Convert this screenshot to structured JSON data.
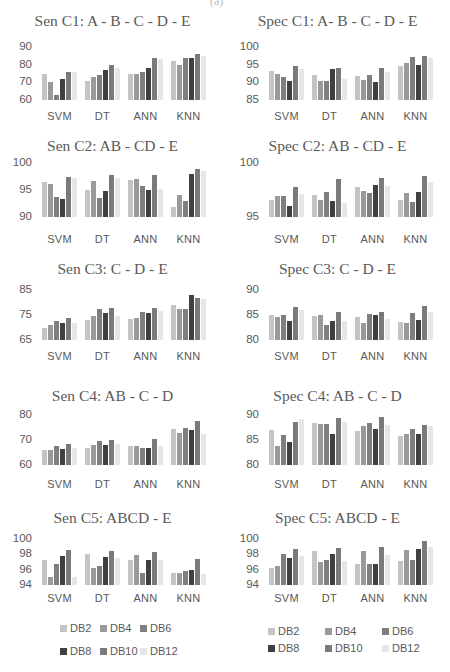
{
  "page_fragment": "(a)",
  "series_names": [
    "DB2",
    "DB4",
    "DB6",
    "DB8",
    "DB10",
    "DB12"
  ],
  "series_colors": [
    "#c4c4c4",
    "#9a9a9a",
    "#7f7f7f",
    "#404040",
    "#7a7a7a",
    "#e6e6e6"
  ],
  "legends": [
    {
      "items": [
        {
          "label": "DB2"
        },
        {
          "label": "DB4"
        },
        {
          "label": "DB6"
        },
        {
          "label": "DB8"
        },
        {
          "label": "DB10"
        },
        {
          "label": "DB12"
        }
      ]
    },
    {
      "items": [
        {
          "label": "DB2"
        },
        {
          "label": "DB4"
        },
        {
          "label": "DB6"
        },
        {
          "label": "DB8"
        },
        {
          "label": "DB10"
        },
        {
          "label": "DB12"
        }
      ]
    }
  ],
  "chart_data": [
    {
      "type": "bar",
      "title": "Sen C1: A - B - C - D - E",
      "xlabel": "",
      "ylabel": "",
      "categories": [
        "SVM",
        "DT",
        "ANN",
        "KNN"
      ],
      "ylim": [
        60,
        90
      ],
      "yticks": [
        "90",
        "80",
        "70",
        "60"
      ],
      "legend_position": "bottom",
      "grid": false,
      "series": [
        {
          "name": "DB2",
          "values": [
            75,
            71,
            75,
            82
          ]
        },
        {
          "name": "DB4",
          "values": [
            70,
            73,
            75,
            80
          ]
        },
        {
          "name": "DB6",
          "values": [
            63,
            74,
            76,
            84
          ]
        },
        {
          "name": "DB8",
          "values": [
            72,
            77,
            78,
            84
          ]
        },
        {
          "name": "DB10",
          "values": [
            76,
            80,
            84,
            86
          ]
        },
        {
          "name": "DB12",
          "values": [
            76,
            78,
            83,
            85
          ]
        }
      ]
    },
    {
      "type": "bar",
      "title": "Spec C1: A- B - C - D - E",
      "xlabel": "",
      "ylabel": "",
      "categories": [
        "SVM",
        "DT",
        "ANN",
        "KNN"
      ],
      "ylim": [
        85,
        100
      ],
      "yticks": [
        "100",
        "95",
        "90",
        "85"
      ],
      "legend_position": "bottom",
      "grid": false,
      "series": [
        {
          "name": "DB2",
          "values": [
            93.2,
            92.2,
            91.8,
            94.5
          ]
        },
        {
          "name": "DB4",
          "values": [
            92.4,
            90.5,
            90.7,
            95.5
          ]
        },
        {
          "name": "DB6",
          "values": [
            91.6,
            90.5,
            92.1,
            97.1
          ]
        },
        {
          "name": "DB8",
          "values": [
            90.5,
            93.8,
            90,
            95
          ]
        },
        {
          "name": "DB10",
          "values": [
            94.5,
            94.2,
            94,
            97.5
          ]
        },
        {
          "name": "DB12",
          "values": [
            93.8,
            91,
            93,
            96.8
          ]
        }
      ]
    },
    {
      "type": "bar",
      "title": "Sen C2: AB - CD - E",
      "xlabel": "",
      "ylabel": "",
      "categories": [
        "SVM",
        "DT",
        "ANN",
        "KNN"
      ],
      "ylim": [
        90,
        100
      ],
      "yticks": [
        "100",
        "95",
        "90"
      ],
      "legend_position": "bottom",
      "grid": false,
      "series": [
        {
          "name": "DB2",
          "values": [
            96.5,
            95,
            96.8,
            91.8
          ]
        },
        {
          "name": "DB4",
          "values": [
            96.2,
            96.7,
            97,
            94
          ]
        },
        {
          "name": "DB6",
          "values": [
            93.7,
            93.5,
            95.8,
            93
          ]
        },
        {
          "name": "DB8",
          "values": [
            93.3,
            94.8,
            95,
            98
          ]
        },
        {
          "name": "DB10",
          "values": [
            97.5,
            97.8,
            97.7,
            98.8
          ]
        },
        {
          "name": "DB12",
          "values": [
            97.2,
            97.2,
            95.2,
            98.5
          ]
        }
      ]
    },
    {
      "type": "bar",
      "title": "Spec C2: AB - CD - E",
      "xlabel": "",
      "ylabel": "",
      "categories": [
        "SVM",
        "DT",
        "ANN",
        "KNN"
      ],
      "ylim": [
        95,
        100
      ],
      "yticks": [
        "100",
        "95"
      ],
      "legend_position": "bottom",
      "grid": false,
      "series": [
        {
          "name": "DB2",
          "values": [
            96.6,
            97,
            97.8,
            96.6
          ]
        },
        {
          "name": "DB4",
          "values": [
            96.9,
            96.6,
            97.4,
            97.2
          ]
        },
        {
          "name": "DB6",
          "values": [
            96.9,
            97.3,
            97.2,
            96.4
          ]
        },
        {
          "name": "DB8",
          "values": [
            96,
            96.5,
            98,
            97.3
          ]
        },
        {
          "name": "DB10",
          "values": [
            97.8,
            98.5,
            98.6,
            98.8
          ]
        },
        {
          "name": "DB12",
          "values": [
            97.1,
            96.3,
            97.9,
            98.2
          ]
        }
      ]
    },
    {
      "type": "bar",
      "title": "Sen C3: C - D - E",
      "xlabel": "",
      "ylabel": "",
      "categories": [
        "SVM",
        "DT",
        "ANN",
        "KNN"
      ],
      "ylim": [
        65,
        85
      ],
      "yticks": [
        "85",
        "75",
        "65"
      ],
      "legend_position": "bottom",
      "grid": false,
      "series": [
        {
          "name": "DB2",
          "values": [
            70,
            73,
            73.5,
            79
          ]
        },
        {
          "name": "DB4",
          "values": [
            71,
            74.5,
            74,
            77.5
          ]
        },
        {
          "name": "DB6",
          "values": [
            72.5,
            77.5,
            76.3,
            77.5
          ]
        },
        {
          "name": "DB8",
          "values": [
            72,
            76,
            76,
            83
          ]
        },
        {
          "name": "DB10",
          "values": [
            74,
            77.8,
            78,
            82
          ]
        },
        {
          "name": "DB12",
          "values": [
            72,
            74.5,
            76.5,
            81.5
          ]
        }
      ]
    },
    {
      "type": "bar",
      "title": "Spec C3: C - D - E",
      "xlabel": "",
      "ylabel": "",
      "categories": [
        "SVM",
        "DT",
        "ANN",
        "KNN"
      ],
      "ylim": [
        80,
        90
      ],
      "yticks": [
        "90",
        "85",
        "80"
      ],
      "legend_position": "bottom",
      "grid": false,
      "series": [
        {
          "name": "DB2",
          "values": [
            85,
            84.8,
            84.6,
            83.6
          ]
        },
        {
          "name": "DB4",
          "values": [
            84.6,
            85.1,
            83.5,
            83.4
          ]
        },
        {
          "name": "DB6",
          "values": [
            85,
            83.1,
            85.3,
            85.4
          ]
        },
        {
          "name": "DB8",
          "values": [
            83.8,
            83.8,
            85,
            84
          ]
        },
        {
          "name": "DB10",
          "values": [
            86.7,
            85.6,
            85.6,
            86.8
          ]
        },
        {
          "name": "DB12",
          "values": [
            86,
            83.8,
            84.3,
            85.6
          ]
        }
      ]
    },
    {
      "type": "bar",
      "title": "Sen C4: AB - C - D",
      "xlabel": "",
      "ylabel": "",
      "categories": [
        "SVM",
        "DT",
        "ANN",
        "KNN"
      ],
      "ylim": [
        60,
        80
      ],
      "yticks": [
        "80",
        "70",
        "60"
      ],
      "legend_position": "bottom",
      "grid": false,
      "series": [
        {
          "name": "DB2",
          "values": [
            66,
            67,
            67.5,
            74.5
          ]
        },
        {
          "name": "DB4",
          "values": [
            66,
            68,
            67.5,
            73
          ]
        },
        {
          "name": "DB6",
          "values": [
            67.5,
            69.5,
            67,
            75
          ]
        },
        {
          "name": "DB8",
          "values": [
            66.5,
            68,
            67,
            74
          ]
        },
        {
          "name": "DB10",
          "values": [
            68.5,
            70,
            70.5,
            77.5
          ]
        },
        {
          "name": "DB12",
          "values": [
            67,
            68.5,
            67.5,
            72.5
          ]
        }
      ]
    },
    {
      "type": "bar",
      "title": "Spec C4: AB - C - D",
      "xlabel": "",
      "ylabel": "",
      "categories": [
        "SVM",
        "DT",
        "ANN",
        "KNN"
      ],
      "ylim": [
        80,
        90
      ],
      "yticks": [
        "90",
        "85",
        "80"
      ],
      "legend_position": "bottom",
      "grid": false,
      "series": [
        {
          "name": "DB2",
          "values": [
            87,
            88.4,
            86.8,
            85.9
          ]
        },
        {
          "name": "DB4",
          "values": [
            83.8,
            88.2,
            87.8,
            86.2
          ]
        },
        {
          "name": "DB6",
          "values": [
            86,
            88.3,
            88.4,
            87.3
          ]
        },
        {
          "name": "DB8",
          "values": [
            84.6,
            86.2,
            87.2,
            86.3
          ]
        },
        {
          "name": "DB10",
          "values": [
            88.7,
            89.5,
            89.6,
            88
          ]
        },
        {
          "name": "DB12",
          "values": [
            89.2,
            88.6,
            88.1,
            87.8
          ]
        }
      ]
    },
    {
      "type": "bar",
      "title": "Sen C5: ABCD - E",
      "xlabel": "",
      "ylabel": "",
      "categories": [
        "SVM",
        "DT",
        "ANN",
        "KNN"
      ],
      "ylim": [
        94,
        100
      ],
      "yticks": [
        "100",
        "98",
        "96",
        "94"
      ],
      "legend_position": "bottom",
      "grid": false,
      "series": [
        {
          "name": "DB2",
          "values": [
            97.3,
            98.1,
            97.2,
            95.6
          ]
        },
        {
          "name": "DB4",
          "values": [
            95.1,
            96.2,
            97.9,
            95.6
          ]
        },
        {
          "name": "DB6",
          "values": [
            96.8,
            96.5,
            95.6,
            95.8
          ]
        },
        {
          "name": "DB8",
          "values": [
            97.8,
            97.7,
            97.3,
            96
          ]
        },
        {
          "name": "DB10",
          "values": [
            98.6,
            98.4,
            98.3,
            97.4
          ]
        },
        {
          "name": "DB12",
          "values": [
            95,
            97.5,
            97.2,
            95.5
          ]
        }
      ]
    },
    {
      "type": "bar",
      "title": "Spec C5: ABCD - E",
      "xlabel": "",
      "ylabel": "",
      "categories": [
        "SVM",
        "DT",
        "ANN",
        "KNN"
      ],
      "ylim": [
        94,
        100
      ],
      "yticks": [
        "100",
        "98",
        "96",
        "94"
      ],
      "legend_position": "bottom",
      "grid": false,
      "series": [
        {
          "name": "DB2",
          "values": [
            96.2,
            98.5,
            96.8,
            97.1
          ]
        },
        {
          "name": "DB4",
          "values": [
            96.5,
            97,
            98.4,
            98.6
          ]
        },
        {
          "name": "DB6",
          "values": [
            98.1,
            97.3,
            96.7,
            97.2
          ]
        },
        {
          "name": "DB8",
          "values": [
            97.5,
            98.1,
            96.8,
            98.7
          ]
        },
        {
          "name": "DB10",
          "values": [
            98.7,
            98.8,
            98.9,
            99.7
          ]
        },
        {
          "name": "DB12",
          "values": [
            97.8,
            97.1,
            97.9,
            98.9
          ]
        }
      ]
    }
  ]
}
